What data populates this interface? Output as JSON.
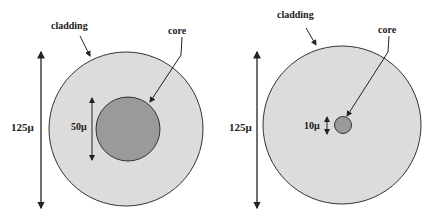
{
  "diagrams": [
    {
      "name": "multimode-fiber",
      "cladding_label": "cladding",
      "core_label": "core",
      "cladding_diameter": "125μ",
      "core_diameter": "50μ"
    },
    {
      "name": "single-mode-fiber",
      "cladding_label": "cladding",
      "core_label": "core",
      "cladding_diameter": "125μ",
      "core_diameter": "10μ"
    }
  ],
  "colors": {
    "cladding_fill": "#dcdcdc",
    "core_fill": "#9a9a9a",
    "stroke": "#333333"
  }
}
